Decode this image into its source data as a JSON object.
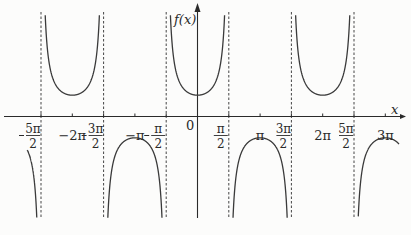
{
  "chart_data": {
    "type": "line",
    "title": "",
    "function": "f(x) = sec(x) = 1/cos(x)",
    "xlabel": "x",
    "ylabel": "f(x)",
    "origin_label": "0",
    "grid": false,
    "xlim": [
      -2.75,
      3.25
    ],
    "xlim_units": "multiples of pi",
    "ylim": [
      -4.8,
      5
    ],
    "x_ticks": [
      {
        "value_pi": -2.5,
        "label": "-5π/2",
        "num": "5π",
        "den": "2",
        "neg": true
      },
      {
        "value_pi": -2,
        "label": "-2π"
      },
      {
        "value_pi": -1.5,
        "label": "-3π/2",
        "num": "3π",
        "den": "2",
        "neg": true
      },
      {
        "value_pi": -1,
        "label": "-π"
      },
      {
        "value_pi": -0.5,
        "label": "-π/2",
        "num": "π",
        "den": "2",
        "neg": true
      },
      {
        "value_pi": 0.5,
        "label": "π/2",
        "num": "π",
        "den": "2",
        "neg": false
      },
      {
        "value_pi": 1,
        "label": "π"
      },
      {
        "value_pi": 1.5,
        "label": "3π/2",
        "num": "3π",
        "den": "2",
        "neg": false
      },
      {
        "value_pi": 2,
        "label": "2π"
      },
      {
        "value_pi": 2.5,
        "label": "5π/2",
        "num": "5π",
        "den": "2",
        "neg": false
      },
      {
        "value_pi": 3,
        "label": "3π"
      }
    ],
    "asymptotes_pi": [
      -2.5,
      -1.5,
      -0.5,
      0.5,
      1.5,
      2.5
    ],
    "asymptote_style": "dashed",
    "local_extrema": [
      {
        "x_pi": -2,
        "y": 1,
        "type": "min"
      },
      {
        "x_pi": -1,
        "y": -1,
        "type": "max"
      },
      {
        "x_pi": 0,
        "y": 1,
        "type": "min"
      },
      {
        "x_pi": 1,
        "y": -1,
        "type": "max"
      },
      {
        "x_pi": 2,
        "y": 1,
        "type": "min"
      },
      {
        "x_pi": 3,
        "y": -1,
        "type": "max"
      }
    ],
    "colors": {
      "curve": "#3a3a3a",
      "axis": "#2a2a2a",
      "asymptote": "#444444",
      "background": "#fcfcfb"
    }
  }
}
